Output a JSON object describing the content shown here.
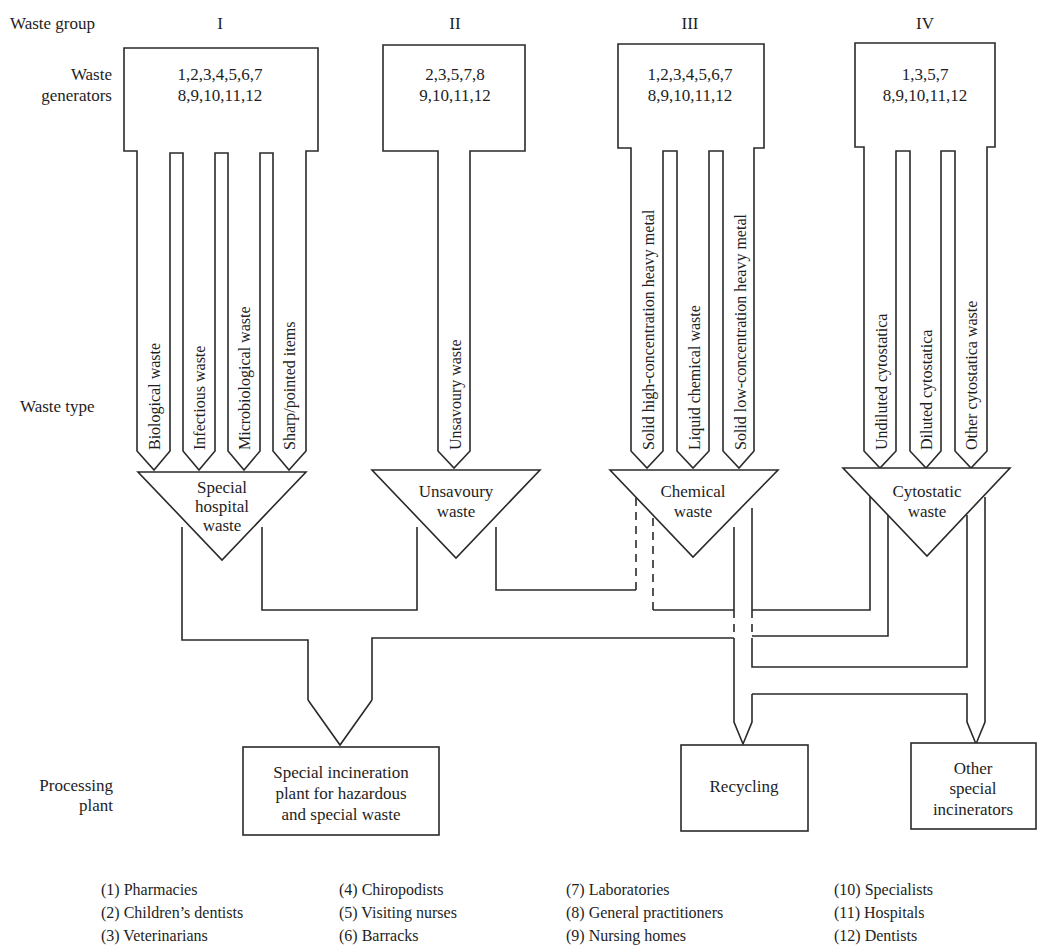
{
  "row_labels": {
    "waste_group": "Waste group",
    "waste_generators_line1": "Waste",
    "waste_generators_line2": "generators",
    "waste_type": "Waste type",
    "processing_plant_line1": "Processing",
    "processing_plant_line2": "plant"
  },
  "groups": [
    {
      "numeral": "I",
      "generators_line1": "1,2,3,4,5,6,7",
      "generators_line2": "8,9,10,11,12",
      "waste_types": [
        "Biological waste",
        "Infectious waste",
        "Microbiological waste",
        "Sharp/pointed items"
      ],
      "collector_line1": "Special",
      "collector_line2": "hospital",
      "collector_line3": "waste"
    },
    {
      "numeral": "II",
      "generators_line1": "2,3,5,7,8",
      "generators_line2": "9,10,11,12",
      "waste_types": [
        "Unsavoury waste"
      ],
      "collector_line1": "Unsavoury",
      "collector_line2": "waste"
    },
    {
      "numeral": "III",
      "generators_line1": "1,2,3,4,5,6,7",
      "generators_line2": "8,9,10,11,12",
      "waste_types": [
        "Solid high-concentration heavy metal",
        "Liquid chemical waste",
        "Solid low-concentration heavy metal"
      ],
      "collector_line1": "Chemical",
      "collector_line2": "waste"
    },
    {
      "numeral": "IV",
      "generators_line1": "1,3,5,7",
      "generators_line2": "8,9,10,11,12",
      "waste_types": [
        "Undiluted cytostatica",
        "Diluted cytostatica",
        "Other cytostatica waste"
      ],
      "collector_line1": "Cytostatic",
      "collector_line2": "waste"
    }
  ],
  "plants": {
    "incineration_line1": "Special incineration",
    "incineration_line2": "plant for hazardous",
    "incineration_line3": "and special waste",
    "recycling": "Recycling",
    "other_line1": "Other",
    "other_line2": "special",
    "other_line3": "incinerators"
  },
  "legend": [
    [
      "(1) Pharmacies",
      "(2) Children’s dentists",
      "(3) Veterinarians"
    ],
    [
      "(4) Chiropodists",
      "(5) Visiting nurses",
      "(6) Barracks"
    ],
    [
      "(7) Laboratories",
      "(8) General practitioners",
      "(9) Nursing homes"
    ],
    [
      "(10) Specialists",
      "(11) Hospitals",
      "(12) Dentists"
    ]
  ]
}
